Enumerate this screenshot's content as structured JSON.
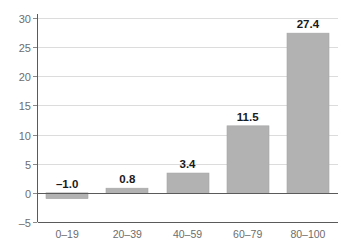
{
  "chart_data": {
    "type": "bar",
    "title": "",
    "subtitle": "",
    "xlabel": "",
    "ylabel": "",
    "categories": [
      "0–19",
      "20–39",
      "40–59",
      "60–79",
      "80–100"
    ],
    "values": [
      -1.0,
      0.8,
      3.4,
      11.5,
      27.4
    ],
    "data_labels": [
      "–1.0",
      "0.8",
      "3.4",
      "11.5",
      "27.4"
    ],
    "ylim": [
      -5,
      30
    ],
    "ytick_values": [
      30,
      25,
      20,
      15,
      10,
      5,
      0,
      -5
    ],
    "ytick_labels": [
      "30",
      "25",
      "20",
      "15",
      "10",
      "5",
      "0",
      "–5"
    ],
    "grid": true,
    "grid_axis": "y",
    "legend": false,
    "legend_position": "none",
    "colors": {
      "bar_fill": "#b2b2b2",
      "bar_stroke": "#a6a6a6",
      "gridline": "#dcdcdc",
      "axis": "#5a5a5a",
      "tick_text": "#6d6d6d",
      "value_text": "#1a1a1a",
      "background": "#ffffff"
    }
  },
  "layout": {
    "plot_left": 37,
    "plot_right": 338,
    "plot_top": 18,
    "plot_bottom": 222,
    "bar_width": 42,
    "value_label_offset": 5,
    "category_label_y": 238,
    "tick_label_x": 31,
    "tick_mark_length": 4
  }
}
